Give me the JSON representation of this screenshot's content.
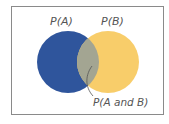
{
  "diagram": {
    "type": "venn",
    "labels": {
      "set_a": "P(A)",
      "set_b": "P(B)",
      "intersection": "P(A and B)"
    },
    "colors": {
      "set_a": "#2f559c",
      "set_b": "#f8cd6a",
      "intersection": "#a3a592",
      "frame": "#8a8a8a",
      "text": "#555555"
    }
  }
}
